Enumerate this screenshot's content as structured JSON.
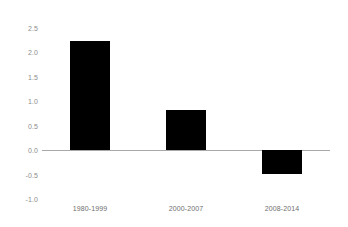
{
  "chart_data": {
    "type": "bar",
    "title": "",
    "subtitle": "",
    "xlabel": "",
    "ylabel": "",
    "categories": [
      "1980-1999",
      "2000-2007",
      "2008-2014"
    ],
    "values": [
      2.23,
      0.82,
      -0.48
    ],
    "series": [
      {
        "name": "",
        "values": [
          2.23,
          0.82,
          -0.48
        ]
      }
    ],
    "ylim": [
      -1.0,
      2.5
    ],
    "yticks": [
      "2.5",
      "2.0",
      "1.5",
      "1.0",
      "0.5",
      "0.0",
      "-0.5",
      "-1.0"
    ],
    "ytick_values": [
      2.5,
      2.0,
      1.5,
      1.0,
      0.5,
      0.0,
      -0.5,
      -1.0
    ],
    "grid": false,
    "legend": false,
    "legend_position": "none",
    "bar_color": "#000000",
    "zero_line_color": "#a8a8a8",
    "tick_label_color": "#8c8c8c",
    "category_label_color": "#6e6e6e",
    "background_color": "#ffffff"
  }
}
